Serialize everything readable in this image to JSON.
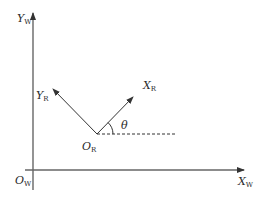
{
  "diagram": {
    "type": "coordinate-frame-diagram",
    "world_frame": {
      "origin_label": "O",
      "origin_sub": "W",
      "x_axis_label": "X",
      "x_axis_sub": "W",
      "y_axis_label": "Y",
      "y_axis_sub": "W"
    },
    "robot_frame": {
      "origin_label": "O",
      "origin_sub": "R",
      "x_axis_label": "X",
      "x_axis_sub": "R",
      "y_axis_label": "Y",
      "y_axis_sub": "R"
    },
    "angle_label": "θ",
    "colors": {
      "line": "#3a3a3a",
      "axis": "#555555",
      "background": "#ffffff"
    }
  }
}
